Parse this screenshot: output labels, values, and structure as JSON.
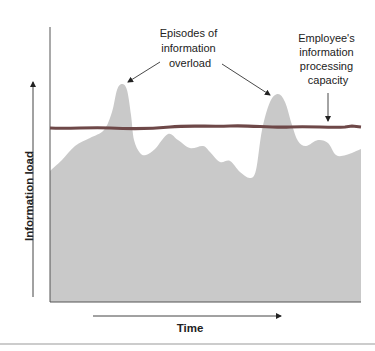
{
  "chart_data": {
    "type": "area",
    "title": "",
    "xlabel": "Time",
    "ylabel": "Information load",
    "grid": false,
    "legend": null,
    "series": [
      {
        "name": "Information load",
        "kind": "area",
        "color": "#c9c9c9",
        "points": [
          [
            50,
            171
          ],
          [
            62,
            160
          ],
          [
            75,
            146
          ],
          [
            90,
            138
          ],
          [
            104,
            130
          ],
          [
            112,
            112
          ],
          [
            117,
            90
          ],
          [
            122,
            84
          ],
          [
            127,
            90
          ],
          [
            131,
            115
          ],
          [
            134,
            140
          ],
          [
            140,
            153
          ],
          [
            146,
            155
          ],
          [
            155,
            149
          ],
          [
            168,
            134
          ],
          [
            178,
            140
          ],
          [
            190,
            148
          ],
          [
            203,
            146
          ],
          [
            210,
            152
          ],
          [
            220,
            162
          ],
          [
            230,
            161
          ],
          [
            240,
            172
          ],
          [
            250,
            178
          ],
          [
            256,
            170
          ],
          [
            262,
            130
          ],
          [
            270,
            102
          ],
          [
            278,
            94
          ],
          [
            285,
            102
          ],
          [
            292,
            125
          ],
          [
            298,
            141
          ],
          [
            306,
            146
          ],
          [
            318,
            140
          ],
          [
            328,
            143
          ],
          [
            336,
            155
          ],
          [
            346,
            155
          ],
          [
            361,
            149
          ]
        ]
      },
      {
        "name": "Employee's information processing capacity",
        "kind": "line",
        "color": "#6e4848",
        "y": 128
      }
    ],
    "annotations": [
      {
        "text": [
          "Episodes of",
          "information",
          "overload"
        ],
        "points_to": [
          "peak 1",
          "peak 2"
        ]
      },
      {
        "text": [
          "Employee's",
          "information",
          "processing",
          "capacity"
        ],
        "points_to": [
          "capacity line"
        ]
      }
    ]
  },
  "annotations": {
    "episodes": [
      "Episodes of",
      "information",
      "overload"
    ],
    "capacity": [
      "Employee's",
      "information",
      "processing",
      "capacity"
    ]
  },
  "axes": {
    "x_label": "Time",
    "y_label": "Information load"
  },
  "colors": {
    "area": "#c9c9c9",
    "capacity_line": "#6e4848",
    "axis": "#333333"
  }
}
